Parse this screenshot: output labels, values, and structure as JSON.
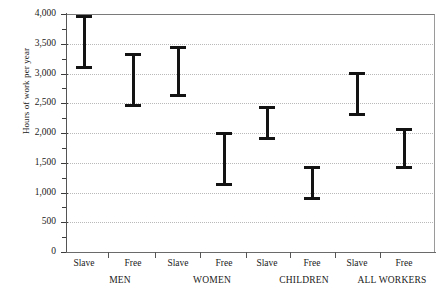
{
  "chart_data": {
    "type": "errorbar",
    "title": "",
    "xlabel": "",
    "ylabel": "Hours of work per year",
    "ylim": [
      0,
      4000
    ],
    "ytick_step": 500,
    "yminor_step": 250,
    "grid": true,
    "legend": "none",
    "ytick_labels": [
      "4,000",
      "3,500",
      "3,000",
      "2,500",
      "2,000",
      "1,500",
      "1,000",
      "500",
      "0"
    ],
    "ytick_values": [
      4000,
      3500,
      3000,
      2500,
      2000,
      1500,
      1000,
      500,
      0
    ],
    "yminor_values": [
      3750,
      3250,
      2750,
      2250,
      1750,
      1250,
      750,
      250
    ],
    "groups": [
      {
        "label": "MEN",
        "center_x": 120
      },
      {
        "label": "WOMEN",
        "center_x": 212
      },
      {
        "label": "CHILDREN",
        "center_x": 304
      },
      {
        "label": "ALL WORKERS",
        "center_x": 392
      }
    ],
    "categories": [
      "MEN / Slave",
      "MEN / Free",
      "WOMEN / Slave",
      "WOMEN / Free",
      "CHILDREN / Slave",
      "CHILDREN / Free",
      "ALL WORKERS / Slave",
      "ALL WORKERS / Free"
    ],
    "series": [
      {
        "name": "Hours of work per year (range)",
        "points": [
          {
            "label": "Slave",
            "group": "MEN",
            "x_px": 84,
            "high": 3980,
            "low": 3075
          },
          {
            "label": "Free",
            "group": "MEN",
            "x_px": 133,
            "high": 3340,
            "low": 2440
          },
          {
            "label": "Slave",
            "group": "WOMEN",
            "x_px": 178,
            "high": 3470,
            "low": 2600
          },
          {
            "label": "Free",
            "group": "WOMEN",
            "x_px": 224,
            "high": 2015,
            "low": 1115
          },
          {
            "label": "Slave",
            "group": "CHILDREN",
            "x_px": 267,
            "high": 2460,
            "low": 1890
          },
          {
            "label": "Free",
            "group": "CHILDREN",
            "x_px": 312,
            "high": 1450,
            "low": 870
          },
          {
            "label": "Slave",
            "group": "ALL WORKERS",
            "x_px": 357,
            "high": 3020,
            "low": 2290
          },
          {
            "label": "Free",
            "group": "ALL WORKERS",
            "x_px": 404,
            "high": 2090,
            "low": 1400
          }
        ]
      }
    ],
    "xtick_separators_px": [
      108,
      155,
      200,
      246,
      290,
      335,
      380
    ],
    "axis": {
      "plot_left_px": 67,
      "plot_right_px": 435,
      "plot_top_px": 14,
      "plot_bottom_px": 252
    }
  }
}
